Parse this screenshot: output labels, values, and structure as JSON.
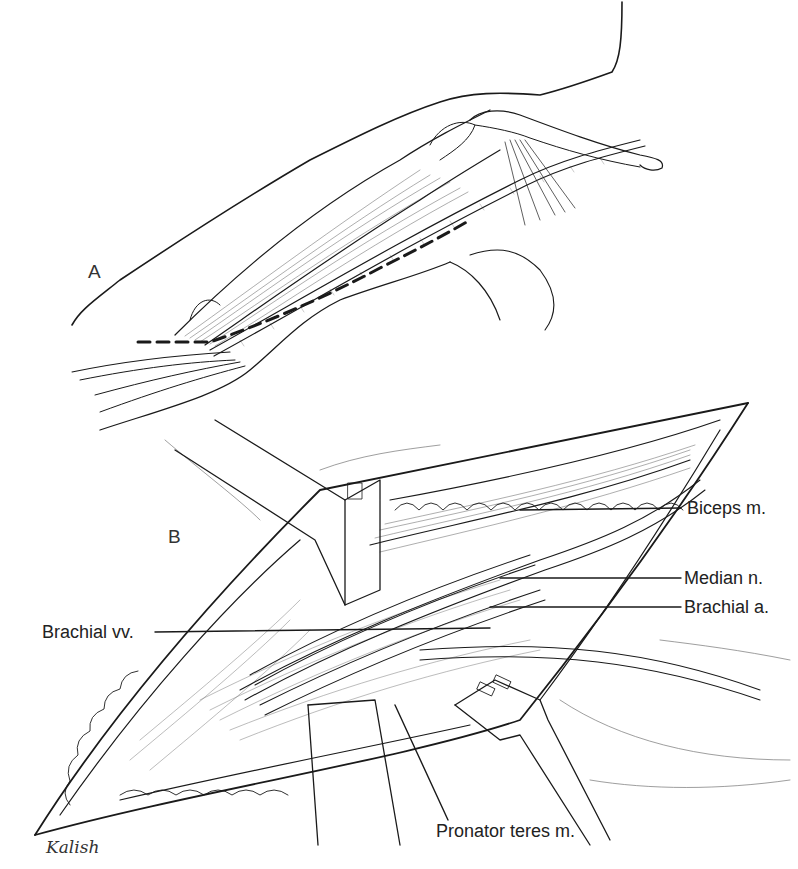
{
  "figure": {
    "panels": [
      {
        "id": "A",
        "letter": "A",
        "description": "Arm surface view with dashed incision line along medial arm"
      },
      {
        "id": "B",
        "letter": "B",
        "description": "Opened incision with retractors exposing neurovascular bundle"
      }
    ],
    "labels": {
      "biceps": "Biceps m.",
      "median": "Median n.",
      "brachial_artery": "Brachial a.",
      "brachial_veins": "Brachial vv.",
      "pronator": "Pronator teres m."
    },
    "signature": "Kalish",
    "colors": {
      "line": "#1a1a1a",
      "background": "#ffffff"
    }
  }
}
